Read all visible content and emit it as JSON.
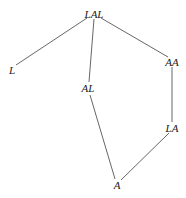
{
  "diagram": {
    "type": "lattice",
    "nodes": [
      {
        "id": "LAL",
        "label": "LAL",
        "x": 94,
        "y": 14
      },
      {
        "id": "L",
        "label": "L",
        "x": 12,
        "y": 70
      },
      {
        "id": "AA",
        "label": "AA",
        "x": 172,
        "y": 62
      },
      {
        "id": "AL",
        "label": "AL",
        "x": 88,
        "y": 88
      },
      {
        "id": "LA",
        "label": "LA",
        "x": 172,
        "y": 128
      },
      {
        "id": "A",
        "label": "A",
        "x": 117,
        "y": 185
      }
    ],
    "edges": [
      {
        "from": "LAL",
        "to": "L"
      },
      {
        "from": "LAL",
        "to": "AL"
      },
      {
        "from": "LAL",
        "to": "AA"
      },
      {
        "from": "AA",
        "to": "LA"
      },
      {
        "from": "AL",
        "to": "A"
      },
      {
        "from": "LA",
        "to": "A"
      }
    ],
    "line_color": "#555555"
  }
}
